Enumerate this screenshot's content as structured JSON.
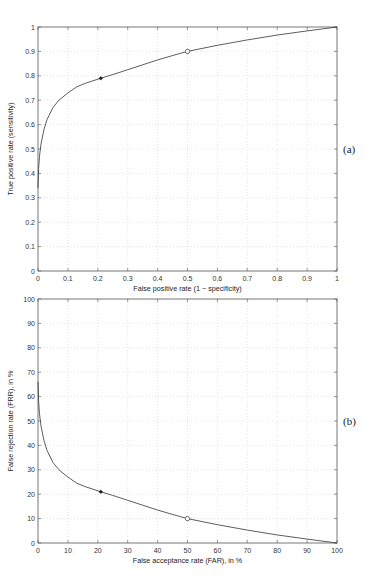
{
  "chart_data": [
    {
      "type": "line",
      "panel_label": "(a)",
      "title": "",
      "xlabel": "False positive rate (1 − specificity)",
      "ylabel": "True positive rate (sensitivity)",
      "xlim": [
        0,
        1
      ],
      "ylim": [
        0,
        1
      ],
      "xticks": [
        "0",
        "0.1",
        "0.2",
        "0.3",
        "0.4",
        "0.5",
        "0.6",
        "0.7",
        "0.8",
        "0.9",
        "1"
      ],
      "yticks": [
        "0",
        "0.1",
        "0.2",
        "0.3",
        "0.4",
        "0.5",
        "0.6",
        "0.7",
        "0.8",
        "0.9",
        "1"
      ],
      "grid": true,
      "series": [
        {
          "name": "ROC curve",
          "x": [
            0,
            0.002,
            0.005,
            0.01,
            0.02,
            0.03,
            0.05,
            0.07,
            0.1,
            0.13,
            0.16,
            0.21,
            0.25,
            0.3,
            0.35,
            0.4,
            0.45,
            0.5,
            0.6,
            0.7,
            0.8,
            0.9,
            1.0
          ],
          "y": [
            0.34,
            0.42,
            0.47,
            0.52,
            0.58,
            0.62,
            0.67,
            0.7,
            0.73,
            0.755,
            0.77,
            0.79,
            0.805,
            0.825,
            0.845,
            0.865,
            0.883,
            0.9,
            0.925,
            0.947,
            0.967,
            0.984,
            1.0
          ]
        }
      ],
      "markers": [
        {
          "shape": "star",
          "x": 0.21,
          "y": 0.79
        },
        {
          "shape": "circle",
          "x": 0.5,
          "y": 0.9
        }
      ]
    },
    {
      "type": "line",
      "panel_label": "(b)",
      "title": "",
      "xlabel": "False acceptance rate (FAR), in %",
      "ylabel": "False rejection rate (FRR), in %",
      "xlim": [
        0,
        100
      ],
      "ylim": [
        0,
        100
      ],
      "xticks": [
        "0",
        "10",
        "20",
        "30",
        "40",
        "50",
        "60",
        "70",
        "80",
        "90",
        "100"
      ],
      "yticks": [
        "0",
        "10",
        "20",
        "30",
        "40",
        "50",
        "60",
        "70",
        "80",
        "90",
        "100"
      ],
      "grid": true,
      "series": [
        {
          "name": "DET curve",
          "x": [
            0,
            0.2,
            0.5,
            1,
            2,
            3,
            5,
            7,
            10,
            13,
            16,
            21,
            25,
            30,
            35,
            40,
            45,
            50,
            60,
            70,
            80,
            90,
            100
          ],
          "y": [
            66,
            58,
            53,
            48,
            42,
            38,
            33,
            30,
            27,
            24.5,
            23,
            21,
            19.5,
            17.5,
            15.5,
            13.5,
            11.7,
            10,
            7.5,
            5.3,
            3.3,
            1.6,
            0
          ]
        }
      ],
      "markers": [
        {
          "shape": "star",
          "x": 21,
          "y": 21
        },
        {
          "shape": "circle",
          "x": 50,
          "y": 10
        }
      ]
    }
  ]
}
